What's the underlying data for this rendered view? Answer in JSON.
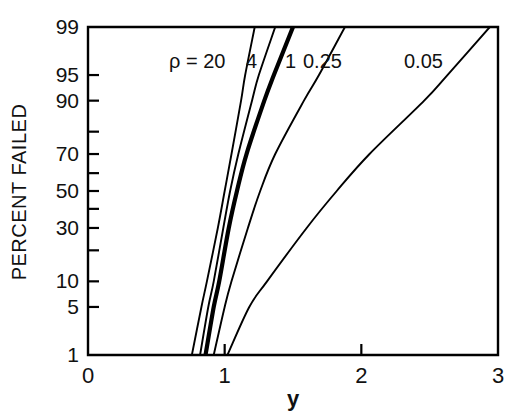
{
  "chart_data": {
    "type": "line",
    "title": "",
    "subtitle": "",
    "xlabel": "y",
    "ylabel": "PERCENT FAILED",
    "xlim": [
      0,
      3
    ],
    "ylim": [
      1,
      99
    ],
    "yscale": "normal-probability",
    "xscale": "linear",
    "grid": false,
    "legend_position": "inline-curve-labels",
    "legend_prefix": "ρ =",
    "xticks": [
      {
        "value": 0,
        "label": "0"
      },
      {
        "value": 1,
        "label": "1"
      },
      {
        "value": 2,
        "label": "2"
      },
      {
        "value": 3,
        "label": "3"
      }
    ],
    "yticks": [
      {
        "value": 99,
        "label": "99"
      },
      {
        "value": 95,
        "label": "95"
      },
      {
        "value": 90,
        "label": "90"
      },
      {
        "value": 80,
        "label": ""
      },
      {
        "value": 70,
        "label": "70"
      },
      {
        "value": 60,
        "label": ""
      },
      {
        "value": 50,
        "label": "50"
      },
      {
        "value": 40,
        "label": ""
      },
      {
        "value": 30,
        "label": "30"
      },
      {
        "value": 20,
        "label": ""
      },
      {
        "value": 10,
        "label": "10"
      },
      {
        "value": 5,
        "label": "5"
      },
      {
        "value": 1,
        "label": "1"
      }
    ],
    "series": [
      {
        "name": "20",
        "label": "ρ = 20",
        "rho": 20,
        "linewidth": "normal",
        "points": [
          {
            "pct": 1,
            "y": 0.76
          },
          {
            "pct": 5,
            "y": 0.83
          },
          {
            "pct": 10,
            "y": 0.87
          },
          {
            "pct": 30,
            "y": 0.95
          },
          {
            "pct": 50,
            "y": 1.0
          },
          {
            "pct": 70,
            "y": 1.05
          },
          {
            "pct": 90,
            "y": 1.12
          },
          {
            "pct": 95,
            "y": 1.15
          },
          {
            "pct": 99,
            "y": 1.22
          }
        ]
      },
      {
        "name": "4",
        "label": "4",
        "rho": 4,
        "linewidth": "normal",
        "points": [
          {
            "pct": 1,
            "y": 0.82
          },
          {
            "pct": 5,
            "y": 0.88
          },
          {
            "pct": 10,
            "y": 0.92
          },
          {
            "pct": 30,
            "y": 0.99
          },
          {
            "pct": 50,
            "y": 1.04
          },
          {
            "pct": 70,
            "y": 1.1
          },
          {
            "pct": 90,
            "y": 1.2
          },
          {
            "pct": 95,
            "y": 1.25
          },
          {
            "pct": 99,
            "y": 1.37
          }
        ]
      },
      {
        "name": "1",
        "label": "1",
        "rho": 1,
        "linewidth": "thick",
        "points": [
          {
            "pct": 1,
            "y": 0.86
          },
          {
            "pct": 5,
            "y": 0.92
          },
          {
            "pct": 10,
            "y": 0.96
          },
          {
            "pct": 30,
            "y": 1.03
          },
          {
            "pct": 50,
            "y": 1.09
          },
          {
            "pct": 70,
            "y": 1.16
          },
          {
            "pct": 90,
            "y": 1.29
          },
          {
            "pct": 95,
            "y": 1.36
          },
          {
            "pct": 99,
            "y": 1.5
          }
        ]
      },
      {
        "name": "0.25",
        "label": "0.25",
        "rho": 0.25,
        "linewidth": "normal",
        "points": [
          {
            "pct": 1,
            "y": 0.92
          },
          {
            "pct": 5,
            "y": 1.0
          },
          {
            "pct": 10,
            "y": 1.05
          },
          {
            "pct": 30,
            "y": 1.17
          },
          {
            "pct": 50,
            "y": 1.26
          },
          {
            "pct": 70,
            "y": 1.37
          },
          {
            "pct": 90,
            "y": 1.58
          },
          {
            "pct": 95,
            "y": 1.69
          },
          {
            "pct": 99,
            "y": 1.88
          }
        ]
      },
      {
        "name": "0.05",
        "label": "0.05",
        "rho": 0.05,
        "linewidth": "normal",
        "points": [
          {
            "pct": 1,
            "y": 1.02
          },
          {
            "pct": 5,
            "y": 1.18
          },
          {
            "pct": 10,
            "y": 1.31
          },
          {
            "pct": 30,
            "y": 1.6
          },
          {
            "pct": 50,
            "y": 1.82
          },
          {
            "pct": 70,
            "y": 2.06
          },
          {
            "pct": 90,
            "y": 2.46
          },
          {
            "pct": 95,
            "y": 2.63
          },
          {
            "pct": 99,
            "y": 2.94
          }
        ]
      }
    ],
    "annotations": [
      {
        "name": "rho-legend",
        "text": "ρ = 20",
        "x_px": 169,
        "y_px": 68
      },
      {
        "name": "curve-label-4",
        "text": "4",
        "x_px": 246,
        "y_px": 68
      },
      {
        "name": "curve-label-1",
        "text": "1",
        "x_px": 285,
        "y_px": 68
      },
      {
        "name": "curve-label-025",
        "text": "0.25",
        "x_px": 303,
        "y_px": 68
      },
      {
        "name": "curve-label-005",
        "text": "0.05",
        "x_px": 404,
        "y_px": 68
      }
    ]
  },
  "axes": {
    "x_label": "y",
    "y_label": "PERCENT FAILED"
  },
  "colors": {
    "line": "#000000",
    "axis": "#000000",
    "background": "#ffffff"
  }
}
